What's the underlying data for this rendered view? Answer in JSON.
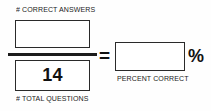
{
  "formula": {
    "title": "Percent Correct Formula",
    "numerator": {
      "label": "# CORRECT ANSWERS",
      "value": "",
      "placeholder": ""
    },
    "denominator": {
      "label": "# TOTAL QUESTIONS",
      "value": "14",
      "placeholder": ""
    },
    "result": {
      "label": "PERCENT CORRECT",
      "value": "",
      "placeholder": ""
    },
    "operators": {
      "equals": "=",
      "percent": "%"
    },
    "colors": {
      "background": "#fefefe",
      "ink": "#1b1b1b",
      "box_border": "#2a2a2a",
      "box_fill": "#ffffff"
    }
  }
}
